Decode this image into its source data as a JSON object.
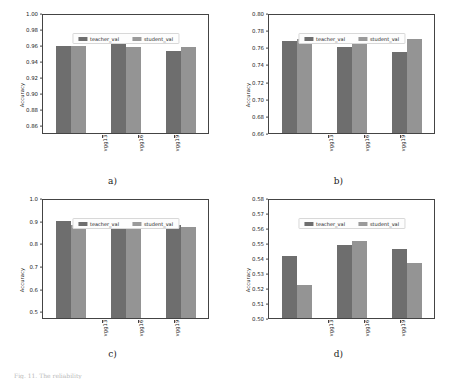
{
  "figure": {
    "legend": {
      "teacher_label": "teacher_val",
      "student_label": "student_val"
    },
    "ylabel": "Accuracy",
    "colors": {
      "teacher": "#6e6e6e",
      "student": "#949494"
    },
    "footnote": "Fig. 11. The reliability"
  },
  "chart_data": [
    {
      "type": "bar",
      "title": "a)",
      "caption": "a)",
      "categories": [
        "vgg13",
        "vgg16",
        "vgg19"
      ],
      "series": [
        {
          "name": "teacher_val",
          "values": [
            0.961,
            0.963,
            0.954
          ]
        },
        {
          "name": "student_val",
          "values": [
            0.961,
            0.959,
            0.959
          ]
        }
      ],
      "xlabel": "",
      "ylabel": "Accuracy",
      "ylim": [
        0.85,
        1.0
      ],
      "yticks": [
        "1.00",
        "0.98",
        "0.96",
        "0.94",
        "0.92",
        "0.90",
        "0.88",
        "0.86"
      ],
      "ytick_values": [
        1.0,
        0.98,
        0.96,
        0.94,
        0.92,
        0.9,
        0.88,
        0.86
      ],
      "grid": false,
      "legend_position": "upper center"
    },
    {
      "type": "bar",
      "title": "b)",
      "caption": "b)",
      "categories": [
        "vgg13",
        "vgg16",
        "vgg19"
      ],
      "series": [
        {
          "name": "teacher_val",
          "values": [
            0.769,
            0.762,
            0.756
          ]
        },
        {
          "name": "student_val",
          "values": [
            0.772,
            0.769,
            0.772
          ]
        }
      ],
      "xlabel": "",
      "ylabel": "Accuracy",
      "ylim": [
        0.66,
        0.8
      ],
      "yticks": [
        "0.80",
        "0.78",
        "0.76",
        "0.74",
        "0.72",
        "0.70",
        "0.68",
        "0.66"
      ],
      "ytick_values": [
        0.8,
        0.78,
        0.76,
        0.74,
        0.72,
        0.7,
        0.68,
        0.66
      ],
      "grid": false,
      "legend_position": "upper center"
    },
    {
      "type": "bar",
      "title": "c)",
      "caption": "c)",
      "categories": [
        "vgg13",
        "vgg16",
        "vgg19"
      ],
      "series": [
        {
          "name": "teacher_val",
          "values": [
            0.905,
            0.903,
            0.887
          ]
        },
        {
          "name": "student_val",
          "values": [
            0.888,
            0.888,
            0.88
          ]
        }
      ],
      "xlabel": "",
      "ylabel": "Accuracy",
      "ylim": [
        0.47,
        1.0
      ],
      "yticks": [
        "1.0",
        "0.9",
        "0.8",
        "0.7",
        "0.6",
        "0.5"
      ],
      "ytick_values": [
        1.0,
        0.9,
        0.8,
        0.7,
        0.6,
        0.5
      ],
      "grid": false,
      "legend_position": "upper center"
    },
    {
      "type": "bar",
      "title": "d)",
      "caption": "d)",
      "categories": [
        "vgg13",
        "vgg16",
        "vgg19"
      ],
      "series": [
        {
          "name": "teacher_val",
          "values": [
            0.542,
            0.5495,
            0.547
          ]
        },
        {
          "name": "student_val",
          "values": [
            0.5225,
            0.552,
            0.537
          ]
        }
      ],
      "xlabel": "",
      "ylabel": "Accuracy",
      "ylim": [
        0.5,
        0.58
      ],
      "yticks": [
        "0.58",
        "0.57",
        "0.56",
        "0.55",
        "0.54",
        "0.53",
        "0.52",
        "0.51",
        "0.50"
      ],
      "ytick_values": [
        0.58,
        0.57,
        0.56,
        0.55,
        0.54,
        0.53,
        0.52,
        0.51,
        0.5
      ],
      "grid": false,
      "legend_position": "upper center"
    }
  ]
}
